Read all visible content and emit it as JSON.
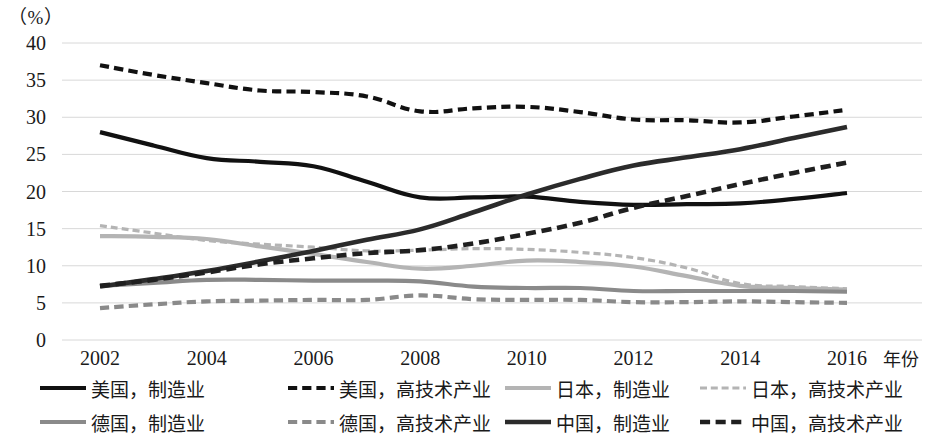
{
  "axis": {
    "unit_label": "（%）",
    "x_title": "年份",
    "y_ticks": [
      "40",
      "35",
      "30",
      "25",
      "20",
      "15",
      "10",
      "5",
      "0"
    ],
    "x_ticks": [
      "2002",
      "2004",
      "2006",
      "2008",
      "2010",
      "2012",
      "2014",
      "2016"
    ]
  },
  "legend": {
    "rows": [
      [
        {
          "label": "美国，制造业",
          "style": "solid",
          "color": "#111111",
          "width": 4.2
        },
        {
          "label": "美国，高技术产业",
          "style": "dashed",
          "color": "#111111",
          "width": 4.2
        },
        {
          "label": "日本，制造业",
          "style": "solid",
          "color": "#b4b4b4",
          "width": 4.2
        },
        {
          "label": "日本，高技术产业",
          "style": "dashed",
          "color": "#b4b4b4",
          "width": 3.2
        }
      ],
      [
        {
          "label": "德国，制造业",
          "style": "solid",
          "color": "#8a8a8a",
          "width": 4.2
        },
        {
          "label": "德国，高技术产业",
          "style": "dashed",
          "color": "#8a8a8a",
          "width": 4.2
        },
        {
          "label": "中国，制造业",
          "style": "solid",
          "color": "#2b2b2b",
          "width": 4.6
        },
        {
          "label": "中国，高技术产业",
          "style": "dashed",
          "color": "#1f1f1f",
          "width": 4.6
        }
      ]
    ]
  },
  "chart_data": {
    "type": "line",
    "title": "",
    "xlabel": "年份",
    "ylabel": "（%）",
    "xlim": [
      2002,
      2016
    ],
    "ylim": [
      0,
      40
    ],
    "ytick_values": [
      0,
      5,
      10,
      15,
      20,
      25,
      30,
      35,
      40
    ],
    "grid": true,
    "legend_position": "bottom",
    "x": [
      2002,
      2003,
      2004,
      2005,
      2006,
      2007,
      2008,
      2009,
      2010,
      2011,
      2012,
      2013,
      2014,
      2015,
      2016
    ],
    "series": [
      {
        "name": "美国，制造业",
        "style": "solid",
        "color": "#111111",
        "width": 4.2,
        "values": [
          28.0,
          26.2,
          24.5,
          24.0,
          23.4,
          21.3,
          19.2,
          19.2,
          19.3,
          18.6,
          18.2,
          18.3,
          18.4,
          19.0,
          19.8
        ]
      },
      {
        "name": "美国，高技术产业",
        "style": "dashed",
        "color": "#111111",
        "width": 4.2,
        "values": [
          37.0,
          35.7,
          34.6,
          33.6,
          33.4,
          32.8,
          30.8,
          31.2,
          31.4,
          30.7,
          29.7,
          29.6,
          29.3,
          30.1,
          31.0
        ]
      },
      {
        "name": "日本，制造业",
        "style": "solid",
        "color": "#b4b4b4",
        "width": 4.2,
        "values": [
          14.0,
          13.9,
          13.6,
          12.6,
          11.6,
          10.5,
          9.6,
          10.0,
          10.7,
          10.5,
          9.9,
          8.6,
          7.3,
          7.0,
          6.8
        ]
      },
      {
        "name": "日本，高技术产业",
        "style": "dashed",
        "color": "#b4b4b4",
        "width": 3.2,
        "values": [
          15.4,
          14.4,
          13.4,
          12.9,
          12.5,
          12.0,
          12.1,
          12.3,
          12.2,
          11.8,
          11.1,
          9.7,
          7.6,
          7.2,
          6.9
        ]
      },
      {
        "name": "德国，制造业",
        "style": "solid",
        "color": "#8a8a8a",
        "width": 4.2,
        "values": [
          7.3,
          7.7,
          8.1,
          8.1,
          8.0,
          8.0,
          7.9,
          7.2,
          7.0,
          7.0,
          6.6,
          6.6,
          6.6,
          6.6,
          6.5
        ]
      },
      {
        "name": "德国，高技术产业",
        "style": "dashed",
        "color": "#8a8a8a",
        "width": 4.2,
        "values": [
          4.3,
          4.8,
          5.2,
          5.3,
          5.4,
          5.4,
          6.0,
          5.5,
          5.4,
          5.4,
          5.1,
          5.1,
          5.2,
          5.1,
          5.0
        ]
      },
      {
        "name": "中国，制造业",
        "style": "solid",
        "color": "#2b2b2b",
        "width": 4.6,
        "values": [
          7.2,
          8.2,
          9.3,
          10.6,
          12.0,
          13.5,
          14.9,
          17.2,
          19.6,
          21.7,
          23.5,
          24.6,
          25.7,
          27.2,
          28.7
        ]
      },
      {
        "name": "中国，高技术产业",
        "style": "dashed",
        "color": "#1f1f1f",
        "width": 4.6,
        "values": [
          7.3,
          8.1,
          9.1,
          10.2,
          11.0,
          11.7,
          12.1,
          13.0,
          14.3,
          15.8,
          17.8,
          19.4,
          21.0,
          22.5,
          23.9
        ]
      }
    ]
  }
}
